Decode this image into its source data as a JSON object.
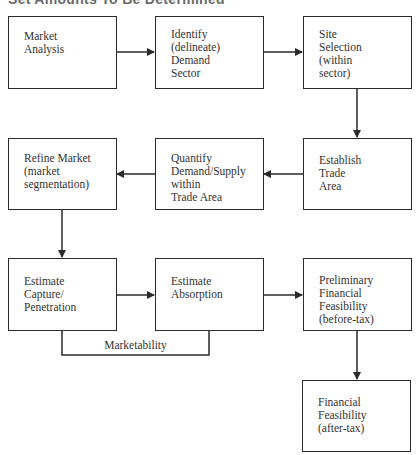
{
  "title": "Set Amounts To Be Determined",
  "boxes": {
    "market_analysis": "Market\nAnalysis",
    "identify_demand_sector": "Identify\n(delineate)\nDemand\nSector",
    "site_selection": "Site\nSelection\n(within\nsector)",
    "refine_market": "Refine Market\n(market\nsegmentation)",
    "quantify_demand_supply": "Quantify\nDemand/Supply\nwithin\nTrade Area",
    "establish_trade_area": "Establish\nTrade\nArea",
    "estimate_capture": "Estimate\nCapture/\nPenetration",
    "estimate_absorption": "Estimate\nAbsorption",
    "preliminary_financial_feasibility": "Preliminary\nFinancial\nFeasibility\n(before-tax)",
    "financial_feasibility": "Financial\nFeasibility\n(after-tax)"
  },
  "bracket_label": "Marketability",
  "colors": {
    "line": "#2a2a2a",
    "text": "#333333"
  }
}
